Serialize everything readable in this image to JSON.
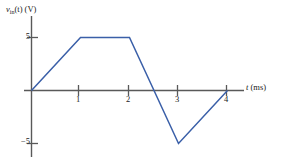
{
  "figure": {
    "axis_color": "#595959",
    "curve_color": "#3a5fa8",
    "background": "#ffffff"
  },
  "labels": {
    "y_axis_var": "v",
    "y_axis_sub": "in",
    "y_axis_rest": "(t) (V)",
    "y_axis_full": "v_in(t) (V)",
    "x_axis_var": "t",
    "x_axis_rest": "(ms)",
    "x_axis_full": "t (ms)"
  },
  "ticks": {
    "y": [
      "5",
      "−5"
    ],
    "x": [
      "1",
      "2",
      "3",
      "4"
    ]
  },
  "chart_data": {
    "type": "line",
    "title": "",
    "xlabel": "t (ms)",
    "ylabel": "v_in(t) (V)",
    "xlim": [
      0,
      4.4
    ],
    "ylim": [
      -6.2,
      6.5
    ],
    "xticks": [
      1,
      2,
      3,
      4
    ],
    "yticks": [
      5,
      -5
    ],
    "grid": false,
    "legend": false,
    "series": [
      {
        "name": "v_in(t)",
        "color": "#3a5fa8",
        "x": [
          0,
          1,
          2,
          3,
          4
        ],
        "y": [
          0,
          5,
          5,
          -5,
          0
        ],
        "zero_crossings": [
          0,
          2.5,
          4
        ],
        "description": "piecewise-linear: ramp 0 to 5 V over 0-1 ms, flat 5 V from 1-2 ms, linear fall from 5 V to -5 V over 2-3 ms (crossing 0 at 2.5 ms), linear rise from -5 V to 0 V over 3-4 ms"
      }
    ]
  }
}
